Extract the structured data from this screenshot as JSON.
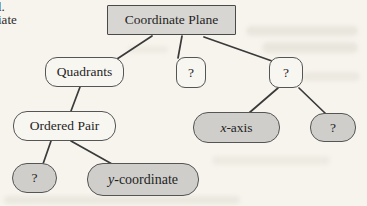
{
  "diagram": {
    "nodes": {
      "coordinate_plane": {
        "label": "Coordinate Plane",
        "shape": "rectangle",
        "fill": "#d7d6d2"
      },
      "quadrants": {
        "label": "Quadrants",
        "shape": "rounded",
        "fill": "#f8f6f1"
      },
      "question_mid": {
        "label": "?",
        "shape": "rounded",
        "fill": "#f8f6f1"
      },
      "question_right": {
        "label": "?",
        "shape": "rounded",
        "fill": "#f8f6f1"
      },
      "ordered_pair": {
        "label": "Ordered Pair",
        "shape": "rounded",
        "fill": "#f8f6f1"
      },
      "x_axis": {
        "label_italic": "x",
        "label_rest": "-axis",
        "shape": "pill",
        "fill": "#cfcecb"
      },
      "question_far_right": {
        "label": "?",
        "shape": "pill",
        "fill": "#cfcecb"
      },
      "question_bottom_left": {
        "label": "?",
        "shape": "pill",
        "fill": "#cfcecb"
      },
      "y_coordinate": {
        "label_italic": "y",
        "label_rest": "-coordinate",
        "shape": "pill",
        "fill": "#cfcecb"
      }
    },
    "edges": [
      {
        "from": "coordinate_plane",
        "to": "quadrants"
      },
      {
        "from": "coordinate_plane",
        "to": "question_mid"
      },
      {
        "from": "coordinate_plane",
        "to": "question_right"
      },
      {
        "from": "quadrants",
        "to": "ordered_pair"
      },
      {
        "from": "ordered_pair",
        "to": "question_bottom_left"
      },
      {
        "from": "ordered_pair",
        "to": "y_coordinate"
      },
      {
        "from": "question_right",
        "to": "x_axis"
      },
      {
        "from": "question_right",
        "to": "question_far_right"
      }
    ],
    "colors": {
      "page_background": "#f7f4ed",
      "node_fill_gray": "#cfcecb",
      "node_fill_light": "#f8f6f1",
      "root_fill": "#d7d6d2",
      "border": "#555555",
      "line": "#3a3a3a"
    }
  },
  "margin_text": {
    "line1": "l.",
    "line2": "iate"
  }
}
